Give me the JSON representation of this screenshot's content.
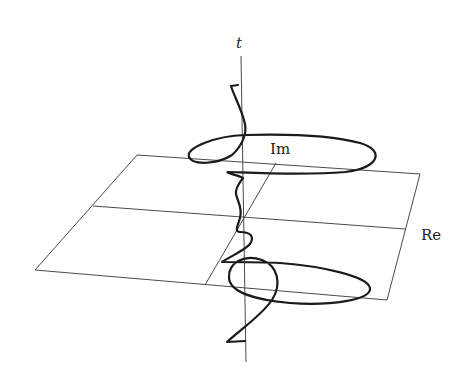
{
  "figure": {
    "type": "3d-curve-over-complex-plane",
    "labels": {
      "time_axis": "t",
      "imaginary_axis": "Im",
      "real_axis": "Re"
    },
    "colors": {
      "background": "#ffffff",
      "plane_lines": "#4a4a4a",
      "curve": "#1a1a1a",
      "text": "#222222"
    }
  }
}
